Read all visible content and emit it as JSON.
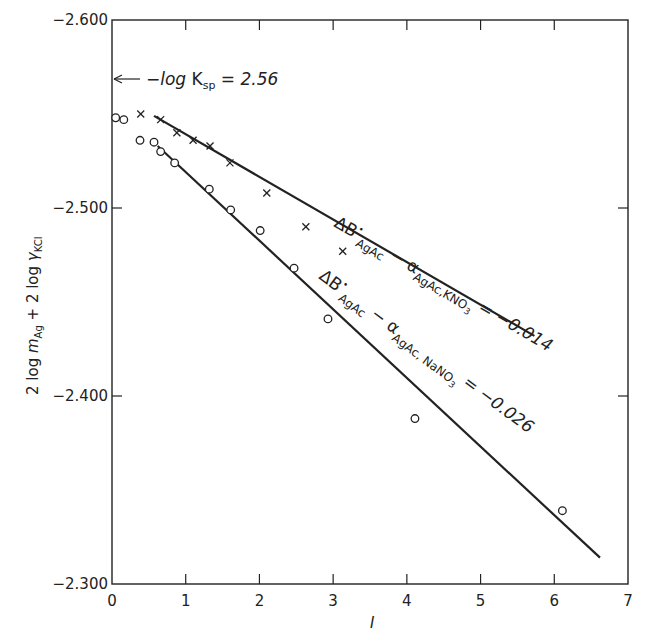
{
  "chart_data": {
    "type": "scatter",
    "title": "",
    "xlabel": "I",
    "ylabel": "2 log m_Ag + 2 log γ_KCl",
    "xlim": [
      0,
      7
    ],
    "ylim": [
      -2.6,
      -2.3
    ],
    "y_inverted": true,
    "x_ticks": [
      0,
      1,
      2,
      3,
      4,
      5,
      6,
      7
    ],
    "x_tick_labels": [
      "0",
      "1",
      "2",
      "3",
      "4",
      "5",
      "6",
      "7"
    ],
    "y_ticks": [
      -2.6,
      -2.5,
      -2.4,
      -2.3
    ],
    "y_tick_labels": [
      "-2.600",
      "-2.500",
      "-2.400",
      "-2.300"
    ],
    "grid": false,
    "series": [
      {
        "name": "KNO3",
        "marker": "x",
        "x": [
          0.39,
          0.66,
          0.88,
          1.1,
          1.33,
          1.6,
          2.1,
          2.63,
          3.13
        ],
        "y": [
          -2.55,
          -2.547,
          -2.54,
          -2.536,
          -2.533,
          -2.524,
          -2.508,
          -2.49,
          -2.477
        ],
        "fit_line": {
          "x": [
            0.57,
            5.73
          ],
          "y": [
            -2.549,
            -2.432
          ]
        },
        "annotation": "ΔB°AgAc − αAgAc,KNO3 = −0.014"
      },
      {
        "name": "NaNO3",
        "marker": "o",
        "x": [
          0.05,
          0.16,
          0.38,
          0.57,
          0.66,
          0.85,
          1.32,
          1.61,
          2.01,
          2.47,
          2.93,
          4.11,
          6.11
        ],
        "y": [
          -2.548,
          -2.547,
          -2.536,
          -2.535,
          -2.53,
          -2.524,
          -2.51,
          -2.499,
          -2.488,
          -2.468,
          -2.441,
          -2.388,
          -2.339
        ],
        "fit_line": {
          "x": [
            0.62,
            6.62
          ],
          "y": [
            -2.533,
            -2.314
          ]
        },
        "annotation": "ΔB°AgAc − αAgAc,NaNO3 = −0.026"
      }
    ],
    "annotations": [
      {
        "text": "−log Ksp = 2.56",
        "arrow_to_y": -2.56,
        "position": "top-left"
      }
    ]
  },
  "labels": {
    "ylabel_parts": {
      "a": "2 log ",
      "m": "m",
      "sub_ag": "Ag",
      "b": " + 2 log ",
      "g": "γ",
      "sub_kcl": "KCl"
    },
    "xlabel": "I",
    "ksp": {
      "prefix": "−",
      "log": "log",
      "K": " K",
      "sub": "sp",
      "value": " = 2.56"
    },
    "knO3_annot": {
      "delta": "ΔB",
      "dot": "•",
      "sub1": "AgAc",
      "minus": " − α",
      "sub2": "AgAc,KNO",
      "sub3": "3",
      "value": " = −0.014"
    },
    "nano3_annot": {
      "delta": "ΔB",
      "dot": "•",
      "sub1": "AgAc",
      "minus": " − α",
      "sub2": "AgAc, NaNO",
      "sub3": "3",
      "value": " = −0.026"
    }
  }
}
